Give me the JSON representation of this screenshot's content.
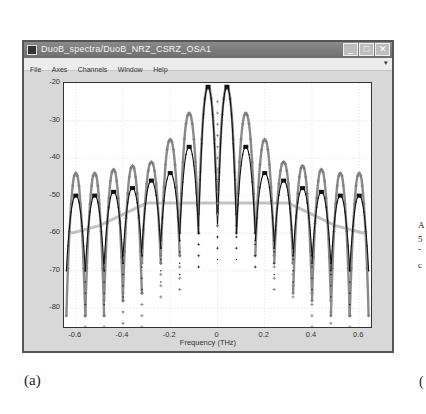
{
  "window": {
    "title": "DuoB_spectra/DuoB_NRZ_CSRZ_OSA1",
    "buttons": {
      "minimize": "_",
      "maximize": "□",
      "close": "✕"
    }
  },
  "menubar": {
    "items": [
      "File",
      "Axes",
      "Channels",
      "Window",
      "Help"
    ],
    "arrow": "▾"
  },
  "caption": "(a)",
  "right_fragments": [
    "A",
    "5",
    "-",
    "c",
    "("
  ],
  "chart_data": {
    "type": "line",
    "title": "",
    "xlabel": "Frequency (THz)",
    "ylabel": "NRZ_uoB_ampitude, dB",
    "xlim": [
      -0.65,
      0.65
    ],
    "ylim": [
      -85,
      -20
    ],
    "xticks": [
      "-0.6",
      "-0.4",
      "-0.2",
      "0",
      "0.2",
      "0.4",
      "0.6"
    ],
    "yticks": [
      "-20",
      "-30",
      "-40",
      "-50",
      "-60",
      "-70",
      "-80"
    ],
    "grid": true,
    "legend": null,
    "series": [
      {
        "name": "gray spectrum (CSRZ-like, '+' markers)",
        "color": "#8a8a8a",
        "peaks_x": [
          -0.6,
          -0.52,
          -0.44,
          -0.36,
          -0.28,
          -0.2,
          -0.12,
          -0.04,
          0.04,
          0.12,
          0.2,
          0.28,
          0.36,
          0.44,
          0.52,
          0.6
        ],
        "peaks_y": [
          -44,
          -44,
          -43,
          -42,
          -41,
          -35,
          -28,
          -21,
          -21,
          -28,
          -35,
          -41,
          -42,
          -43,
          -44,
          -44
        ],
        "nulls_y": [
          -82,
          -82,
          -78,
          -76,
          -68,
          -66,
          -60,
          -55,
          -55,
          -60,
          -66,
          -68,
          -76,
          -78,
          -82,
          -82
        ]
      },
      {
        "name": "black spectrum (NRZ-like, dots)",
        "color": "#111111",
        "peaks_x": [
          -0.6,
          -0.52,
          -0.44,
          -0.36,
          -0.28,
          -0.2,
          -0.12,
          -0.04,
          0.04,
          0.12,
          0.2,
          0.28,
          0.36,
          0.44,
          0.52,
          0.6
        ],
        "peaks_y": [
          -50,
          -50,
          -49,
          -48,
          -46,
          -44,
          -37,
          -21,
          -21,
          -37,
          -44,
          -46,
          -48,
          -49,
          -50,
          -50
        ],
        "nulls_y": [
          -70,
          -70,
          -68,
          -66,
          -64,
          -62,
          -60,
          -58,
          -58,
          -60,
          -62,
          -64,
          -66,
          -68,
          -70,
          -70
        ]
      },
      {
        "name": "gray lower envelope",
        "color": "#9a9a9a",
        "x": [
          -0.62,
          -0.5,
          -0.4,
          -0.3,
          0.3,
          0.4,
          0.5,
          0.62
        ],
        "y": [
          -60,
          -58,
          -55,
          -52,
          -52,
          -55,
          -58,
          -60
        ]
      }
    ]
  }
}
